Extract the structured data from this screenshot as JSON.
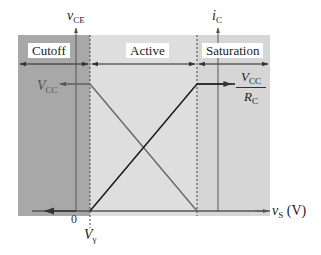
{
  "regions": [
    {
      "label": "Cutoff",
      "color": "#a6a6a6"
    },
    {
      "label": "Active",
      "color": "#dedede"
    },
    {
      "label": "Saturation",
      "color": "#d4d4d4"
    }
  ],
  "axes": {
    "left_y": {
      "symbol": "v",
      "subscript": "CE"
    },
    "right_y": {
      "symbol": "i",
      "subscript": "C"
    },
    "x": {
      "symbol": "v",
      "subscript": "S",
      "unit": "(V)"
    }
  },
  "labels": {
    "vcc": {
      "symbol": "V",
      "subscript": "CC"
    },
    "vcc_over_rc": {
      "num_symbol": "V",
      "num_subscript": "CC",
      "den_symbol": "R",
      "den_subscript": "C"
    },
    "origin": "0",
    "v_gamma": {
      "symbol": "V",
      "subscript": "γ"
    }
  },
  "curves": [
    {
      "name": "v_CE",
      "description": "Equals VCC in cutoff, decreases linearly through active region to 0 at saturation boundary",
      "color": "#666666"
    },
    {
      "name": "i_C",
      "description": "Zero in cutoff, increases linearly through active region to VCC/RC at saturation boundary, then constant",
      "color": "#1a1a1a"
    }
  ],
  "colors": {
    "panel_bg": "#d9d9d9",
    "cutoff_bg": "#a6a6a6",
    "boundary_dash": "#555555",
    "axis": "#555555"
  }
}
